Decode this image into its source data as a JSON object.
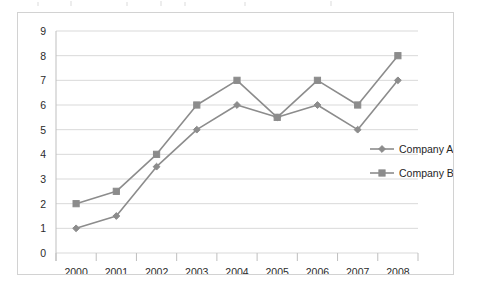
{
  "chart_data": {
    "type": "line",
    "title": "",
    "subtitle": "",
    "xlabel": "",
    "ylabel": "",
    "categories": [
      "2000",
      "2001",
      "2002",
      "2003",
      "2004",
      "2005",
      "2006",
      "2007",
      "2008"
    ],
    "series": [
      {
        "name": "Company A",
        "marker": "diamond",
        "color": "#8c8c8c",
        "values": [
          1,
          1.5,
          3.5,
          5,
          6,
          5.5,
          6,
          5,
          7
        ]
      },
      {
        "name": "Company B",
        "marker": "square",
        "color": "#8c8c8c",
        "values": [
          2,
          2.5,
          4,
          6,
          7,
          5.5,
          7,
          6,
          8
        ]
      }
    ],
    "ylim": [
      0,
      9
    ],
    "ytick_labels": [
      "0",
      "1",
      "2",
      "3",
      "4",
      "5",
      "6",
      "7",
      "8",
      "9"
    ],
    "ytick_values": [
      0,
      1,
      2,
      3,
      4,
      5,
      6,
      7,
      8,
      9
    ],
    "grid": true,
    "grid_axis": "y",
    "legend_position": "right",
    "legend_entries": [
      "Company A",
      "Company B"
    ]
  },
  "style": {
    "line_color": "#8c8c8c",
    "grid_color": "#d9d9d9",
    "axis_color": "#bfbfbf",
    "frame_color": "#d2d2d2",
    "text_color": "#2b2b2b",
    "background": "#ffffff"
  }
}
